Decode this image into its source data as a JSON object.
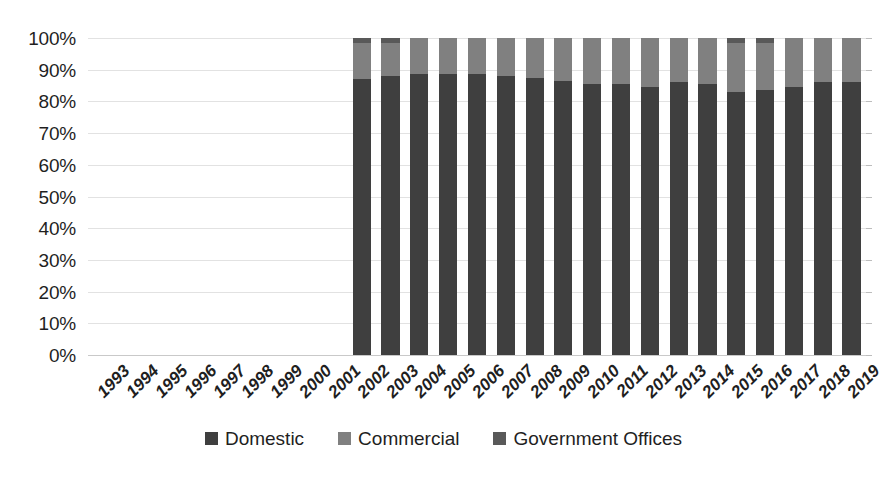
{
  "chart_data": {
    "type": "bar",
    "stacked": true,
    "stack_mode": "percent",
    "title": "",
    "subtitle": "",
    "xlabel": "",
    "ylabel": "",
    "ylim": [
      0,
      100
    ],
    "ytick_labels": [
      "100%",
      "90%",
      "80%",
      "70%",
      "60%",
      "50%",
      "40%",
      "30%",
      "20%",
      "10%",
      "0%"
    ],
    "ytick_values": [
      100,
      90,
      80,
      70,
      60,
      50,
      40,
      30,
      20,
      10,
      0
    ],
    "grid": true,
    "legend_position": "bottom",
    "categories": [
      "1993",
      "1994",
      "1995",
      "1996",
      "1997",
      "1998",
      "1999",
      "2000",
      "2001",
      "2002",
      "2003",
      "2004",
      "2005",
      "2006",
      "2007",
      "2008",
      "2009",
      "2010",
      "2011",
      "2012",
      "2013",
      "2014",
      "2015",
      "2016",
      "2017",
      "2018",
      "2019"
    ],
    "series": [
      {
        "name": "Domestic",
        "color": "#3f3f3f",
        "values": [
          null,
          null,
          null,
          null,
          null,
          null,
          null,
          null,
          null,
          87.0,
          88.0,
          88.5,
          88.5,
          88.5,
          88.0,
          87.5,
          86.5,
          85.5,
          85.5,
          84.5,
          86.0,
          85.5,
          83.0,
          83.5,
          84.5,
          86.0,
          86.0
        ]
      },
      {
        "name": "Commercial",
        "color": "#808080",
        "values": [
          null,
          null,
          null,
          null,
          null,
          null,
          null,
          null,
          null,
          11.5,
          10.5,
          11.5,
          11.5,
          11.5,
          12.0,
          12.5,
          13.5,
          14.5,
          14.5,
          15.5,
          14.0,
          14.5,
          15.5,
          15.0,
          15.5,
          14.0,
          14.0
        ]
      },
      {
        "name": "Government Offices",
        "color": "#595959",
        "values": [
          null,
          null,
          null,
          null,
          null,
          null,
          null,
          null,
          null,
          1.5,
          1.5,
          0.0,
          0.0,
          0.0,
          0.0,
          0.0,
          0.0,
          0.0,
          0.0,
          0.0,
          0.0,
          0.0,
          1.5,
          1.5,
          0.0,
          0.0,
          0.0
        ]
      }
    ]
  },
  "legend": {
    "items": [
      {
        "label": "Domestic",
        "color": "#3f3f3f"
      },
      {
        "label": "Commercial",
        "color": "#808080"
      },
      {
        "label": "Government Offices",
        "color": "#595959"
      }
    ]
  },
  "colors": {
    "background": "#ffffff",
    "gridline": "#e2e2e2",
    "axis": "#c9c9c9",
    "text": "#1f1f1f",
    "domestic": "#3f3f3f",
    "commercial": "#808080",
    "government_offices": "#595959"
  }
}
